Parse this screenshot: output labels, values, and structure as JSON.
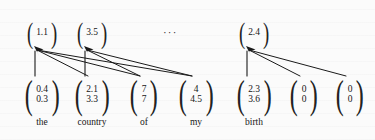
{
  "figure": {
    "ellipsis": "···",
    "ink_color": "#1a1a1a",
    "background_color": "#fbfbfb"
  },
  "top_row": {
    "label": "aggregated representations",
    "nodes": [
      {
        "id": "top-0",
        "values": [
          "1.1"
        ],
        "x": 22,
        "y": 16,
        "w": 40,
        "h": 34
      },
      {
        "id": "top-1",
        "values": [
          "3.5"
        ],
        "x": 72,
        "y": 16,
        "w": 40,
        "h": 34
      },
      {
        "id": "top-2",
        "values": [
          "2.4"
        ],
        "x": 234,
        "y": 16,
        "w": 40,
        "h": 34
      }
    ]
  },
  "bottom_row": {
    "label": "token embeddings",
    "nodes": [
      {
        "id": "bot-0",
        "values": [
          "0.4",
          "0.3"
        ],
        "word": "the",
        "x": 22,
        "y": 77,
        "w": 40,
        "h": 36
      },
      {
        "id": "bot-1",
        "values": [
          "2.1",
          "3.3"
        ],
        "word": "country",
        "x": 72,
        "y": 77,
        "w": 40,
        "h": 36
      },
      {
        "id": "bot-2",
        "values": [
          "7",
          "7"
        ],
        "word": "of",
        "x": 124,
        "y": 77,
        "w": 40,
        "h": 36
      },
      {
        "id": "bot-3",
        "values": [
          "4",
          "4.5"
        ],
        "word": "my",
        "x": 176,
        "y": 77,
        "w": 40,
        "h": 36
      },
      {
        "id": "bot-4",
        "values": [
          "2.3",
          "3.6"
        ],
        "word": "birth",
        "x": 234,
        "y": 77,
        "w": 40,
        "h": 36
      },
      {
        "id": "bot-5",
        "values": [
          "0",
          "0"
        ],
        "word": "",
        "x": 284,
        "y": 77,
        "w": 40,
        "h": 36
      },
      {
        "id": "bot-6",
        "values": [
          "0",
          "0"
        ],
        "word": "",
        "x": 330,
        "y": 77,
        "w": 40,
        "h": 36
      }
    ]
  },
  "edges": [
    {
      "from": "bot-0",
      "to": "top-0",
      "kind": "stub"
    },
    {
      "from": "bot-1",
      "to": "top-0",
      "kind": "diagonal"
    },
    {
      "from": "bot-2",
      "to": "top-0",
      "kind": "diagonal"
    },
    {
      "from": "bot-3",
      "to": "top-0",
      "kind": "diagonal"
    },
    {
      "from": "bot-1",
      "to": "top-1",
      "kind": "stub"
    },
    {
      "from": "bot-2",
      "to": "top-1",
      "kind": "diagonal"
    },
    {
      "from": "bot-3",
      "to": "top-1",
      "kind": "diagonal"
    },
    {
      "from": "bot-4",
      "to": "top-2",
      "kind": "stub"
    },
    {
      "from": "bot-5",
      "to": "top-2",
      "kind": "diagonal"
    },
    {
      "from": "bot-6",
      "to": "top-2",
      "kind": "diagonal"
    }
  ]
}
